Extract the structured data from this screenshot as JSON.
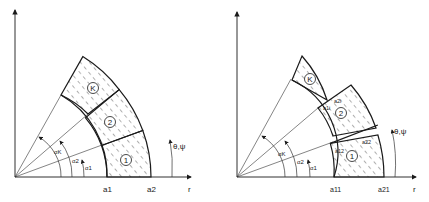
{
  "figure": {
    "left_panel": {
      "axis_label_r": "r",
      "angle_label": "θ,ψ",
      "radius_labels": [
        "a1",
        "a2"
      ],
      "regions": [
        "1",
        "2",
        "K"
      ],
      "angle_labels": [
        "α1",
        "α2",
        "αK"
      ]
    },
    "right_panel": {
      "axis_label_r": "r",
      "angle_label": "θ,ψ",
      "radius_labels": [
        "a11",
        "a21"
      ],
      "inner_labels": [
        "a12",
        "a22",
        "a1i",
        "a2i"
      ],
      "regions": [
        "1",
        "2",
        "K"
      ],
      "angle_labels": [
        "α1",
        "α2",
        "αK"
      ]
    },
    "colors": {
      "line": "#1a1a1a",
      "hatch": "#333333",
      "background": "#ffffff"
    }
  }
}
